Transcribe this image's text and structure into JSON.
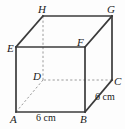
{
  "figure": {
    "kind": "cuboid-net-diagram",
    "background_color": "#fdfdfd",
    "solid_edge_color": "#3b3b3b",
    "hidden_edge_color": "#9a9a9a",
    "label_color": "#1a1a1a"
  },
  "vertices": [
    {
      "name": "A",
      "label": "A",
      "x": 16,
      "y": 112,
      "label_x": 10,
      "label_y": 114,
      "hidden": false
    },
    {
      "name": "B",
      "label": "B",
      "x": 85,
      "y": 112,
      "label_x": 80,
      "label_y": 114,
      "hidden": false
    },
    {
      "name": "C",
      "label": "C",
      "x": 112,
      "y": 80,
      "label_x": 114,
      "label_y": 76,
      "hidden": false
    },
    {
      "name": "D",
      "label": "D",
      "x": 43,
      "y": 80,
      "label_x": 33,
      "label_y": 71,
      "hidden": true
    },
    {
      "name": "E",
      "label": "E",
      "x": 16,
      "y": 47,
      "label_x": 7,
      "label_y": 43,
      "hidden": false
    },
    {
      "name": "F",
      "label": "F",
      "x": 85,
      "y": 47,
      "label_x": 77,
      "label_y": 37,
      "hidden": false
    },
    {
      "name": "G",
      "label": "G",
      "x": 112,
      "y": 16,
      "label_x": 107,
      "label_y": 4,
      "hidden": false
    },
    {
      "name": "H",
      "label": "H",
      "x": 43,
      "y": 16,
      "label_x": 38,
      "label_y": 4,
      "hidden": false
    }
  ],
  "edges": [
    {
      "name": "edge-A-B",
      "from": "A",
      "to": "B",
      "style": "solid"
    },
    {
      "name": "edge-B-C",
      "from": "B",
      "to": "C",
      "style": "solid"
    },
    {
      "name": "edge-C-D",
      "from": "C",
      "to": "D",
      "style": "dashed"
    },
    {
      "name": "edge-D-A",
      "from": "D",
      "to": "A",
      "style": "dashed"
    },
    {
      "name": "edge-E-F",
      "from": "E",
      "to": "F",
      "style": "solid"
    },
    {
      "name": "edge-F-G",
      "from": "F",
      "to": "G",
      "style": "solid"
    },
    {
      "name": "edge-G-H",
      "from": "G",
      "to": "H",
      "style": "solid"
    },
    {
      "name": "edge-H-E",
      "from": "H",
      "to": "E",
      "style": "solid"
    },
    {
      "name": "edge-A-E",
      "from": "A",
      "to": "E",
      "style": "solid"
    },
    {
      "name": "edge-B-F",
      "from": "B",
      "to": "F",
      "style": "solid"
    },
    {
      "name": "edge-C-G",
      "from": "C",
      "to": "G",
      "style": "solid"
    },
    {
      "name": "edge-D-H",
      "from": "D",
      "to": "H",
      "style": "dashed"
    }
  ],
  "dimensions": [
    {
      "name": "dimension-ab",
      "text": "6 cm",
      "edge": "edge-A-B",
      "x": 36,
      "y": 113
    },
    {
      "name": "dimension-bc",
      "text": "6 cm",
      "edge": "edge-B-C",
      "x": 95,
      "y": 92
    }
  ]
}
